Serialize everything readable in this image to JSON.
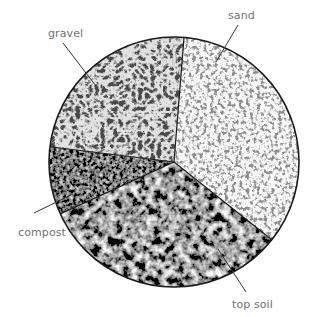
{
  "chart_data": {
    "type": "pie",
    "title": "",
    "center": [
      174,
      162
    ],
    "radius": 125,
    "start_angle_deg": 85.4,
    "direction": "clockwise",
    "slices": [
      {
        "label": "sand",
        "value": 34.4,
        "sweep_deg": 123.9,
        "texture": "fine-light-speckle",
        "base_color": "#f4f4f4",
        "grain_color": "#7a7a7a"
      },
      {
        "label": "top soil",
        "value": 32.5,
        "sweep_deg": 117.0,
        "texture": "dark-coarse-mottled",
        "base_color": "#4a4a4a",
        "grain_color": "#1a1a1a"
      },
      {
        "label": "compost",
        "value": 8.8,
        "sweep_deg": 31.5,
        "texture": "very-dark-fine",
        "base_color": "#3a3a3a",
        "grain_color": "#111111"
      },
      {
        "label": "gravel",
        "value": 24.3,
        "sweep_deg": 87.6,
        "texture": "light-pebbles",
        "base_color": "#d8d8d8",
        "grain_color": "#3c3c3c"
      }
    ],
    "labels": [
      {
        "text": "gravel",
        "x": 48,
        "y": 27,
        "leader": [
          [
            63,
            43
          ],
          [
            96,
            86
          ]
        ]
      },
      {
        "text": "sand",
        "x": 228,
        "y": 9,
        "leader": [
          [
            238,
            25
          ],
          [
            216,
            62
          ]
        ]
      },
      {
        "text": "compost",
        "x": 18,
        "y": 226,
        "leader": [
          [
            34,
            213
          ],
          [
            73,
            194
          ]
        ]
      },
      {
        "text": "top soil",
        "x": 232,
        "y": 298,
        "leader": [
          [
            246,
            292
          ],
          [
            218,
            249
          ]
        ]
      }
    ],
    "legend": "none",
    "grid": false
  },
  "colors": {
    "outline": "#1a1a1a",
    "label_text": "#6f6f6f",
    "leader_line": "#333333",
    "background": "#ffffff"
  }
}
